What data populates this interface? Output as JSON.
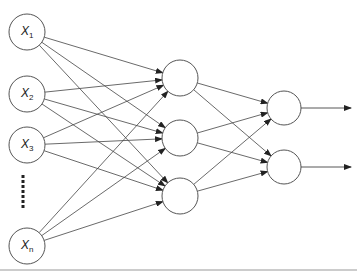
{
  "diagram": {
    "type": "feedforward-neural-network",
    "layers": [
      {
        "name": "input",
        "nodes": [
          {
            "label": "X",
            "subscript": "1"
          },
          {
            "label": "X",
            "subscript": "2"
          },
          {
            "label": "X",
            "subscript": "3"
          },
          {
            "label": "X",
            "subscript": "n"
          }
        ],
        "ellipsis": true
      },
      {
        "name": "hidden",
        "nodes": [
          {
            "label": ""
          },
          {
            "label": ""
          },
          {
            "label": ""
          }
        ]
      },
      {
        "name": "output",
        "nodes": [
          {
            "label": ""
          },
          {
            "label": ""
          }
        ],
        "output_arrows": true
      }
    ],
    "connectivity": "fully-connected",
    "colors": {
      "stroke": "#444444",
      "node_fill": "#ffffff",
      "text": "#222222",
      "rule": "#9a9a9a"
    }
  }
}
